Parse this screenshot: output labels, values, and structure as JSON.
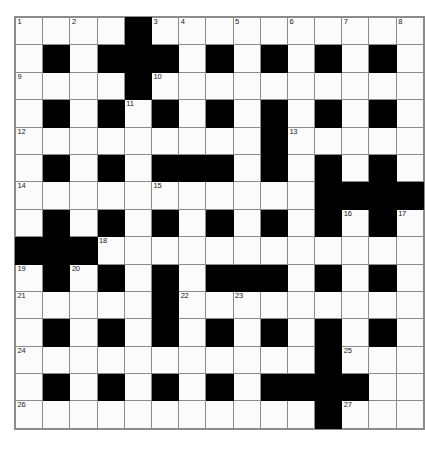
{
  "puzzle": {
    "title": "Crossword Grid",
    "rows": 15,
    "columns": 15,
    "cell_colors": {
      "white": "#fbfbfb",
      "black": "#000000",
      "grid_line": "#8c8c8c",
      "number_text": "#1a1a1a",
      "page_background": "#ffffff"
    },
    "grid": [
      [
        "w",
        "w",
        "w",
        "w",
        "b",
        "w",
        "w",
        "w",
        "w",
        "w",
        "w",
        "w",
        "w",
        "w",
        "w"
      ],
      [
        "w",
        "b",
        "w",
        "b",
        "b",
        "b",
        "w",
        "b",
        "w",
        "b",
        "w",
        "b",
        "w",
        "b",
        "w"
      ],
      [
        "w",
        "w",
        "w",
        "w",
        "b",
        "w",
        "w",
        "w",
        "w",
        "w",
        "w",
        "w",
        "w",
        "w",
        "w"
      ],
      [
        "w",
        "b",
        "w",
        "b",
        "w",
        "b",
        "w",
        "b",
        "w",
        "b",
        "w",
        "b",
        "w",
        "b",
        "w"
      ],
      [
        "w",
        "w",
        "w",
        "w",
        "w",
        "w",
        "w",
        "w",
        "w",
        "b",
        "w",
        "w",
        "w",
        "w",
        "w"
      ],
      [
        "w",
        "b",
        "w",
        "b",
        "w",
        "b",
        "b",
        "b",
        "w",
        "b",
        "w",
        "b",
        "w",
        "b",
        "w"
      ],
      [
        "w",
        "w",
        "w",
        "w",
        "w",
        "w",
        "w",
        "w",
        "w",
        "w",
        "w",
        "b",
        "b",
        "b",
        "b"
      ],
      [
        "w",
        "b",
        "w",
        "b",
        "w",
        "b",
        "w",
        "b",
        "w",
        "b",
        "w",
        "b",
        "w",
        "b",
        "w"
      ],
      [
        "b",
        "b",
        "b",
        "w",
        "w",
        "w",
        "w",
        "w",
        "w",
        "w",
        "w",
        "w",
        "w",
        "w",
        "w"
      ],
      [
        "w",
        "b",
        "w",
        "b",
        "w",
        "b",
        "w",
        "b",
        "b",
        "b",
        "w",
        "b",
        "w",
        "b",
        "w"
      ],
      [
        "w",
        "w",
        "w",
        "w",
        "w",
        "b",
        "w",
        "w",
        "w",
        "w",
        "w",
        "w",
        "w",
        "w",
        "w"
      ],
      [
        "w",
        "b",
        "w",
        "b",
        "w",
        "b",
        "w",
        "b",
        "w",
        "b",
        "w",
        "b",
        "w",
        "b",
        "w"
      ],
      [
        "w",
        "w",
        "w",
        "w",
        "w",
        "w",
        "w",
        "w",
        "w",
        "w",
        "w",
        "b",
        "w",
        "w",
        "w"
      ],
      [
        "w",
        "b",
        "w",
        "b",
        "w",
        "b",
        "w",
        "b",
        "w",
        "b",
        "b",
        "b",
        "b",
        "w",
        "w"
      ],
      [
        "w",
        "w",
        "w",
        "w",
        "w",
        "w",
        "w",
        "w",
        "w",
        "w",
        "w",
        "b",
        "w",
        "w",
        "w"
      ]
    ],
    "numbers": [
      {
        "row": 1,
        "col": 1,
        "label": "1"
      },
      {
        "row": 1,
        "col": 3,
        "label": "2"
      },
      {
        "row": 1,
        "col": 6,
        "label": "3"
      },
      {
        "row": 1,
        "col": 7,
        "label": "4"
      },
      {
        "row": 1,
        "col": 9,
        "label": "5"
      },
      {
        "row": 1,
        "col": 11,
        "label": "6"
      },
      {
        "row": 1,
        "col": 13,
        "label": "7"
      },
      {
        "row": 1,
        "col": 15,
        "label": "8"
      },
      {
        "row": 3,
        "col": 1,
        "label": "9"
      },
      {
        "row": 3,
        "col": 6,
        "label": "10"
      },
      {
        "row": 4,
        "col": 5,
        "label": "11"
      },
      {
        "row": 5,
        "col": 1,
        "label": "12"
      },
      {
        "row": 5,
        "col": 11,
        "label": "13"
      },
      {
        "row": 7,
        "col": 1,
        "label": "14"
      },
      {
        "row": 7,
        "col": 6,
        "label": "15"
      },
      {
        "row": 8,
        "col": 13,
        "label": "16"
      },
      {
        "row": 8,
        "col": 15,
        "label": "17"
      },
      {
        "row": 9,
        "col": 4,
        "label": "18"
      },
      {
        "row": 10,
        "col": 1,
        "label": "19"
      },
      {
        "row": 10,
        "col": 3,
        "label": "20"
      },
      {
        "row": 11,
        "col": 1,
        "label": "21"
      },
      {
        "row": 11,
        "col": 7,
        "label": "22"
      },
      {
        "row": 11,
        "col": 9,
        "label": "23"
      },
      {
        "row": 13,
        "col": 1,
        "label": "24"
      },
      {
        "row": 13,
        "col": 13,
        "label": "25"
      },
      {
        "row": 15,
        "col": 1,
        "label": "26"
      },
      {
        "row": 15,
        "col": 13,
        "label": "27"
      }
    ]
  }
}
